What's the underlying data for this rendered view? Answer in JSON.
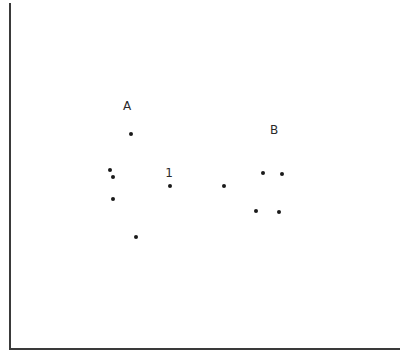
{
  "chart_data": {
    "type": "scatter",
    "title": "",
    "xlabel": "",
    "ylabel": "",
    "grid": false,
    "legend": null,
    "pixel_frame": {
      "origin": [
        10,
        349
      ],
      "x_end": 400,
      "y_top": 3
    },
    "annotations": [
      {
        "text": "A",
        "x": 127,
        "y": 106
      },
      {
        "text": "B",
        "x": 274,
        "y": 130
      },
      {
        "text": "1",
        "x": 169,
        "y": 173
      }
    ],
    "series": [
      {
        "name": "points",
        "points": [
          {
            "x": 131,
            "y": 134
          },
          {
            "x": 110,
            "y": 170
          },
          {
            "x": 113,
            "y": 177
          },
          {
            "x": 113,
            "y": 199
          },
          {
            "x": 136,
            "y": 237
          },
          {
            "x": 170,
            "y": 186
          },
          {
            "x": 224,
            "y": 186
          },
          {
            "x": 263,
            "y": 173
          },
          {
            "x": 282,
            "y": 174
          },
          {
            "x": 256,
            "y": 211
          },
          {
            "x": 279,
            "y": 212
          }
        ]
      }
    ]
  }
}
